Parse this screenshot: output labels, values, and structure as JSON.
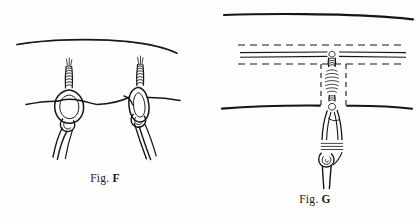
{
  "plate": {
    "background_color": "#fdfdfc",
    "ink_color": "#161616",
    "figures": [
      {
        "id": "fig-f",
        "caption_word": "Fig.",
        "caption_letter": "F",
        "description": "Two timber-hitch style knots tied on a horizontal rope with whipped standing ends",
        "elements": [
          "upper-curved-rope",
          "horizontal-rope",
          "left-knot",
          "right-knot",
          "left-knot-tail",
          "right-knot-tail"
        ]
      },
      {
        "id": "fig-g",
        "caption_word": "Fig.",
        "caption_letter": "G",
        "description": "Vertical seizing and lashing between two horizontal ropes, with dashed construction guide lines",
        "elements": [
          "upper-solid-rope",
          "upper-dashed-guide",
          "double-line-rope",
          "lower-dashed-guide",
          "vertical-dashed-guide-left",
          "vertical-dashed-guide-right",
          "lower-solid-rope-left",
          "lower-solid-rope-right",
          "vertical-seizing",
          "lower-lashing",
          "bottom-tail"
        ]
      }
    ]
  }
}
